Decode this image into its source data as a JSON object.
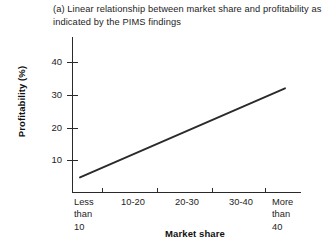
{
  "figure": {
    "label": "(a) Linear relationship between market share and profitability as indicated by the PIMS findings",
    "title_line1": "(a) Linear relationship between market share and",
    "title_line2": "profitability as indicated by the PIMS findings"
  },
  "axes": {
    "y_title": "Profitability (%)",
    "x_title": "Market share",
    "y_ticks": [
      "10",
      "20",
      "30",
      "40"
    ],
    "x_ticks": [
      "Less\nthan\n10",
      "10-20",
      "20-30",
      "30-40",
      "More\nthan\n40"
    ]
  },
  "chart_data": {
    "type": "line",
    "title": "(a) Linear relationship between market share and profitability as indicated by the PIMS findings",
    "xlabel": "Market share",
    "ylabel": "Profitability (%)",
    "categories": [
      "Less than 10",
      "10-20",
      "20-30",
      "30-40",
      "More than 40"
    ],
    "series": [
      {
        "name": "PIMS profitability trend",
        "values": [
          4.5,
          11.5,
          18.5,
          25.5,
          32.0
        ]
      }
    ],
    "ylim": [
      0,
      48
    ],
    "yticks": [
      10,
      20,
      30,
      40
    ],
    "grid": false,
    "legend": false,
    "line_color": "#2a2a2a",
    "annotations": []
  },
  "style": {
    "line_color": "#2a2a2a",
    "axis_color": "#2a2a2a",
    "text_color": "#1d1d1d",
    "background": "#ffffff"
  }
}
